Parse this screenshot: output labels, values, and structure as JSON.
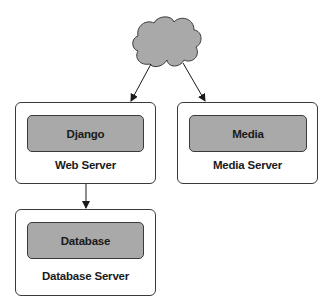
{
  "diagram": {
    "cloud": {
      "icon": "cloud-icon",
      "fill": "#a9a9a9",
      "stroke": "#3a3a3a"
    },
    "nodes": [
      {
        "id": "web-server",
        "server_label": "Web Server",
        "app_label": "Django"
      },
      {
        "id": "media-server",
        "server_label": "Media Server",
        "app_label": "Media"
      },
      {
        "id": "database-server",
        "server_label": "Database Server",
        "app_label": "Database"
      }
    ],
    "edges": [
      {
        "from": "cloud",
        "to": "web-server"
      },
      {
        "from": "cloud",
        "to": "media-server"
      },
      {
        "from": "web-server",
        "to": "database-server"
      }
    ],
    "colors": {
      "app_fill": "#a9a9a9",
      "server_fill": "#ffffff",
      "stroke": "#3a3a3a",
      "text": "#1a1a1a"
    }
  }
}
